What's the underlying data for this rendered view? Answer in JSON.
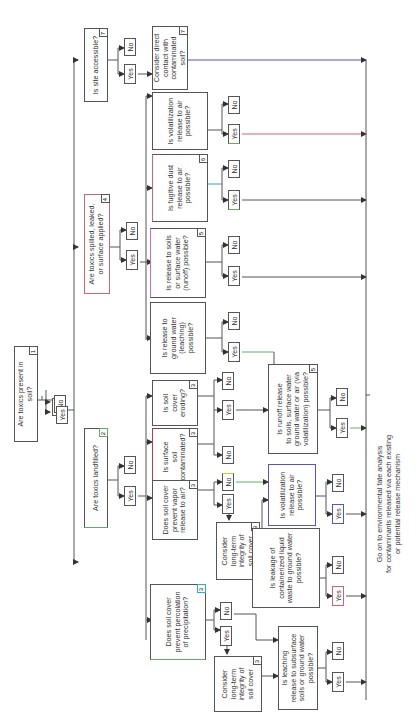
{
  "diagram": {
    "orientation": "rotated 90 degrees counter-clockwise",
    "nodes": {
      "q1": {
        "text": "Are toxics present in\nsoil?",
        "num": "1"
      },
      "q2": {
        "text": "Are toxics landfilled?",
        "num": "2"
      },
      "q4": {
        "text": "Are toxics spilled, leaked,\nor surface applied?",
        "num": "4"
      },
      "q7": {
        "text": "Is site accessible?",
        "num": "7"
      },
      "c7": {
        "text": "Consider direct\ncontact with\ncontaminated\nsoil?",
        "num": "7"
      },
      "vol_air": {
        "text": "Is volatilization\nrelease to air\npossible?"
      },
      "dust": {
        "text": "Is fugitive dust\nrelease to air\npossible?",
        "num": "6"
      },
      "runoff": {
        "text": "Is release to soils\nor surface water\n(runoff) possible?",
        "num": "5"
      },
      "leach_gw": {
        "text": "Is release to\nground water\n(leaching)\npossible?"
      },
      "erode": {
        "text": "Is soil\ncover\neroding?",
        "num": "3"
      },
      "surf_cont": {
        "text": "Is surface\nsoil\ncontaminated?",
        "num": "3"
      },
      "vapor": {
        "text": "Does soil cover\nprevent vapor\nrelease to air?",
        "num": "3"
      },
      "perc": {
        "text": "Does soil cover\nprevent percolation\nof precipitation?",
        "num": "3"
      },
      "integ1": {
        "text": "Consider\nlong-term\nintegrity of\nsoil cover",
        "num": "3"
      },
      "integ2": {
        "text": "Consider\nlong-term\nintegrity of\nsoil cover",
        "num": "3"
      },
      "runoff2": {
        "text": "Is runoff release\nto soils, surface water\nground water or air (via\nvolatilization) possible?",
        "num": "5"
      },
      "vol2": {
        "text": "Is volatilization\nrelease to air\npossible?"
      },
      "leakage": {
        "text": "Is leakage of\ncontainerized liquid\nwaste to ground water\npossible?"
      },
      "leach_sub": {
        "text": "Is leaching\nrelease to subsurface\nsoils or ground water\npossible?"
      }
    },
    "labels": {
      "yes": "Yes",
      "no": "No"
    },
    "footer": "Go on to environmental fate analysis\nfor contaminants released via each existing\nor potential release mechanism",
    "colors": {
      "line": "#555555",
      "accent_blue": "#5555bb",
      "accent_red": "#cc6677",
      "accent_green": "#66aa66"
    }
  }
}
